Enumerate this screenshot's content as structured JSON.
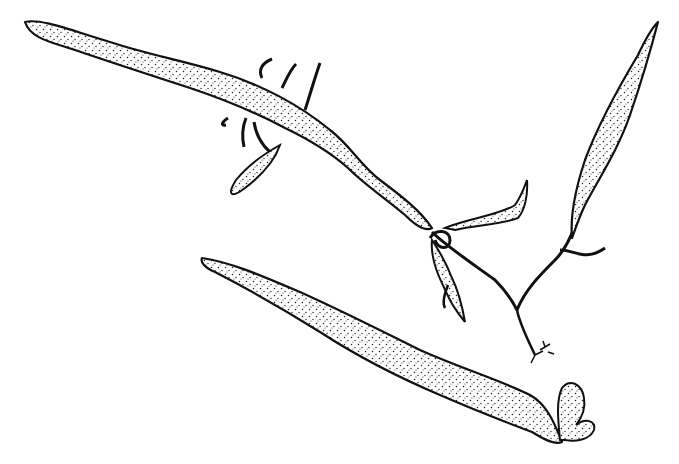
{
  "illustration": {
    "type": "botanical stipple line drawing",
    "subject": "Elongated strap-like fronds (seaweed / thallus) with rhizoids and small lobes",
    "background_color": "#ffffff",
    "ink_color": "#111111",
    "fronds": [
      {
        "name": "upper-left-frond",
        "description": "Long wavy stippled frond spanning from top-left to center"
      },
      {
        "name": "right-upright-frond",
        "description": "Narrow upright stippled frond at upper right"
      },
      {
        "name": "lower-frond",
        "description": "Long stippled frond at bottom with small bilobed tip"
      }
    ]
  }
}
